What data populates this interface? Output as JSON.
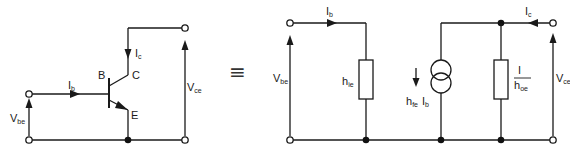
{
  "diagram": {
    "title": "",
    "equivalence_symbol": "≡",
    "left_circuit": {
      "name": "Common-emitter BJT",
      "labels": {
        "base": "B",
        "collector": "C",
        "emitter": "E",
        "base_current": "I",
        "base_current_sub": "b",
        "collector_current": "I",
        "collector_current_sub": "c",
        "vbe": "V",
        "vbe_sub": "be",
        "vce": "V",
        "vce_sub": "ce"
      }
    },
    "right_circuit": {
      "name": "h-parameter equivalent circuit",
      "labels": {
        "input_current": "I",
        "input_current_sub": "b",
        "output_current": "I",
        "output_current_sub": "c",
        "vbe": "V",
        "vbe_sub": "be",
        "vce": "V",
        "vce_sub": "ce",
        "hie": "h",
        "hie_sub": "ie",
        "source_h": "h",
        "source_h_sub": "fe",
        "source_i": "I",
        "source_i_sub": "b",
        "hoe_num": "I",
        "hoe_den": "h",
        "hoe_den_sub": "oe"
      }
    }
  }
}
